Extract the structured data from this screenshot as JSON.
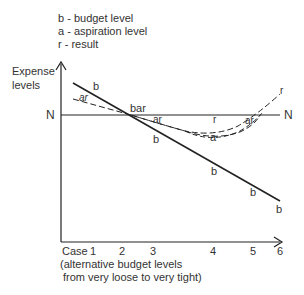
{
  "legend": {
    "b": "b - budget level",
    "a": "a - aspiration level",
    "r": "r - result"
  },
  "y_axis": {
    "label_line1": "Expense",
    "label_line2": "levels",
    "n_label_left": "N",
    "n_label_right": "N"
  },
  "x_axis": {
    "case_label": "Case",
    "ticks": [
      "1",
      "2",
      "3",
      "4",
      "5",
      "6"
    ],
    "caption_line1": "(alternative budget levels",
    "caption_line2": "from very loose to very tight)"
  },
  "curve_labels": {
    "b_start": "b",
    "ar_start": "ar",
    "bar": "bar",
    "ar_mid": "ar",
    "b_mid": "b",
    "r_low": "r",
    "a_low": "a",
    "ar_cross": "ar",
    "r_end": "r",
    "b_4": "b",
    "b_5": "b",
    "b_end": "b"
  },
  "colors": {
    "line": "#222222",
    "text": "#333333"
  }
}
